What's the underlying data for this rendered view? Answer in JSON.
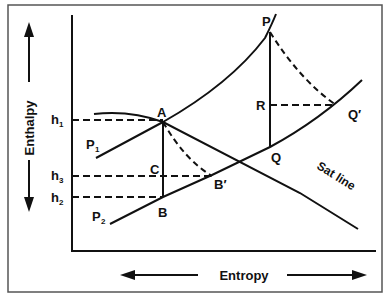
{
  "diagram": {
    "axes": {
      "y_label": "Enthalpy",
      "x_label": "Entropy"
    },
    "enthalpy_levels": [
      {
        "id": "h1",
        "label": "h",
        "sub": "1"
      },
      {
        "id": "h3",
        "label": "h",
        "sub": "3"
      },
      {
        "id": "h2",
        "label": "h",
        "sub": "2"
      }
    ],
    "pressure_lines": [
      {
        "id": "P1",
        "label": "P",
        "sub": "1"
      },
      {
        "id": "P2",
        "label": "P",
        "sub": "2"
      }
    ],
    "points": {
      "A": "A",
      "B": "B",
      "B_prime": "B′",
      "C": "C",
      "P": "P",
      "Q": "Q",
      "Q_prime": "Q′",
      "R": "R"
    },
    "curve_labels": {
      "sat_line": "Sat line"
    },
    "colors": {
      "line": "#111111",
      "border": "#555555",
      "background": "#ffffff"
    }
  }
}
